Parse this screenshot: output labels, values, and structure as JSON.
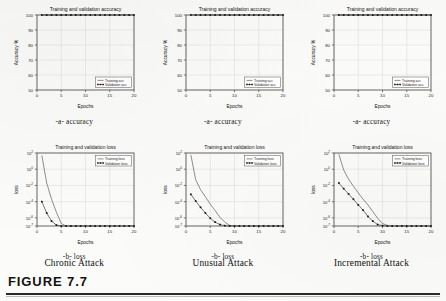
{
  "figure": {
    "label": "FIGURE 7.7"
  },
  "columns": [
    {
      "attack_caption": "Chronic Attack",
      "accuracy_subcaption": "-a- accuracy",
      "loss_subcaption": "-b- loss"
    },
    {
      "attack_caption": "Unusual Attack",
      "accuracy_subcaption": "-a- accuracy",
      "loss_subcaption": "-b- loss"
    },
    {
      "attack_caption": "Incremental Attack",
      "accuracy_subcaption": "-a- accuracy",
      "loss_subcaption": "-b- loss"
    }
  ],
  "chart_data": [
    {
      "type": "line",
      "panel": "chronic-accuracy",
      "title": "Training and validation accuracy",
      "xlabel": "Epochs",
      "ylabel": "Accuracy %",
      "xlim": [
        0,
        20
      ],
      "ylim": [
        50,
        100
      ],
      "xticks": [
        0,
        5,
        10,
        15,
        20
      ],
      "yticks": [
        50,
        60,
        70,
        80,
        90,
        100
      ],
      "grid": true,
      "legend_position": "lower right",
      "series": [
        {
          "name": "Training acc",
          "marker": "none",
          "x": [
            1,
            2,
            3,
            4,
            5,
            6,
            7,
            8,
            9,
            10,
            11,
            12,
            13,
            14,
            15,
            16,
            17,
            18,
            19,
            20
          ],
          "values": [
            100,
            100,
            100,
            100,
            100,
            100,
            100,
            100,
            100,
            100,
            100,
            100,
            100,
            100,
            100,
            100,
            100,
            100,
            100,
            100
          ]
        },
        {
          "name": "Validation acc",
          "marker": "square",
          "x": [
            1,
            2,
            3,
            4,
            5,
            6,
            7,
            8,
            9,
            10,
            11,
            12,
            13,
            14,
            15,
            16,
            17,
            18,
            19,
            20
          ],
          "values": [
            100,
            100,
            100,
            100,
            100,
            100,
            100,
            100,
            100,
            100,
            100,
            100,
            100,
            100,
            100,
            100,
            100,
            100,
            100,
            100
          ]
        }
      ]
    },
    {
      "type": "line",
      "panel": "chronic-loss",
      "title": "Training and validation loss",
      "xlabel": "Epochs",
      "ylabel": "loss",
      "yscale": "log",
      "xlim": [
        0,
        20
      ],
      "ylim": [
        1e-07,
        100.0
      ],
      "xticks": [
        0,
        5,
        10,
        15,
        20
      ],
      "yticks": [
        "10^2",
        "10^0",
        "10^-2",
        "10^-4",
        "10^-6",
        "10^-7"
      ],
      "grid": true,
      "legend_position": "upper right",
      "series": [
        {
          "name": "Training loss",
          "marker": "none",
          "x": [
            1,
            2,
            3,
            4,
            5,
            6,
            7,
            8,
            9,
            10,
            11,
            12,
            13,
            14,
            15,
            16,
            17,
            18,
            19,
            20
          ],
          "values": [
            50,
            0.02,
            0.0002,
            5e-06,
            2e-07,
            1e-07,
            1e-07,
            1e-07,
            1e-07,
            1e-07,
            1e-07,
            1e-07,
            1e-07,
            1e-07,
            1e-07,
            1e-07,
            1e-07,
            1e-07,
            1e-07,
            1e-07
          ]
        },
        {
          "name": "Validation loss",
          "marker": "square",
          "x": [
            1,
            2,
            3,
            4,
            5,
            6,
            7,
            8,
            9,
            10,
            11,
            12,
            13,
            14,
            15,
            16,
            17,
            18,
            19,
            20
          ],
          "values": [
            0.0001,
            4e-06,
            4e-07,
            1.3e-07,
            1e-07,
            1e-07,
            1e-07,
            1e-07,
            1e-07,
            1e-07,
            1e-07,
            1e-07,
            1e-07,
            1e-07,
            1e-07,
            1e-07,
            1e-07,
            1e-07,
            1e-07,
            1e-07
          ]
        }
      ]
    },
    {
      "type": "line",
      "panel": "unusual-accuracy",
      "title": "Training and validation accuracy",
      "xlabel": "Epochs",
      "ylabel": "Accuracy %",
      "xlim": [
        0,
        20
      ],
      "ylim": [
        50,
        100
      ],
      "xticks": [
        0,
        5,
        10,
        15,
        20
      ],
      "yticks": [
        50,
        60,
        70,
        80,
        90,
        100
      ],
      "grid": true,
      "legend_position": "lower right",
      "series": [
        {
          "name": "Training acc",
          "marker": "none",
          "x": [
            1,
            2,
            3,
            4,
            5,
            6,
            7,
            8,
            9,
            10,
            11,
            12,
            13,
            14,
            15,
            16,
            17,
            18,
            19,
            20
          ],
          "values": [
            100,
            100,
            100,
            100,
            100,
            100,
            100,
            100,
            100,
            100,
            100,
            100,
            100,
            100,
            100,
            100,
            100,
            100,
            100,
            100
          ]
        },
        {
          "name": "Validation acc",
          "marker": "square",
          "x": [
            1,
            2,
            3,
            4,
            5,
            6,
            7,
            8,
            9,
            10,
            11,
            12,
            13,
            14,
            15,
            16,
            17,
            18,
            19,
            20
          ],
          "values": [
            100,
            100,
            100,
            100,
            100,
            100,
            100,
            100,
            100,
            100,
            100,
            100,
            100,
            100,
            100,
            100,
            100,
            100,
            100,
            100
          ]
        }
      ]
    },
    {
      "type": "line",
      "panel": "unusual-loss",
      "title": "Training and validation loss",
      "xlabel": "Epochs",
      "ylabel": "loss",
      "yscale": "log",
      "xlim": [
        0,
        20
      ],
      "ylim": [
        1e-07,
        100.0
      ],
      "xticks": [
        0,
        5,
        10,
        15,
        20
      ],
      "yticks": [
        "10^2",
        "10^0",
        "10^-2",
        "10^-4",
        "10^-6",
        "10^-7"
      ],
      "grid": true,
      "legend_position": "upper right",
      "series": [
        {
          "name": "Training loss",
          "marker": "none",
          "x": [
            1,
            2,
            3,
            4,
            5,
            6,
            7,
            8,
            9,
            10,
            11,
            12,
            13,
            14,
            15,
            16,
            17,
            18,
            19,
            20
          ],
          "values": [
            60,
            0.05,
            0.003,
            0.0004,
            5e-05,
            8e-06,
            1.2e-06,
            3e-07,
            1.2e-07,
            1e-07,
            1e-07,
            1e-07,
            1e-07,
            1e-07,
            1e-07,
            1e-07,
            1e-07,
            1e-07,
            1e-07,
            1e-07
          ]
        },
        {
          "name": "Validation loss",
          "marker": "square",
          "x": [
            1,
            2,
            3,
            4,
            5,
            6,
            7,
            8,
            9,
            10,
            11,
            12,
            13,
            14,
            15,
            16,
            17,
            18,
            19,
            20
          ],
          "values": [
            0.0008,
            0.00012,
            2e-05,
            4e-06,
            9e-07,
            3e-07,
            1.5e-07,
            1.1e-07,
            1e-07,
            1e-07,
            1e-07,
            1e-07,
            1e-07,
            1e-07,
            1e-07,
            1e-07,
            1e-07,
            1e-07,
            1e-07,
            1e-07
          ]
        }
      ]
    },
    {
      "type": "line",
      "panel": "incremental-accuracy",
      "title": "Training and validation accuracy",
      "xlabel": "Epochs",
      "ylabel": "Accuracy %",
      "xlim": [
        0,
        20
      ],
      "ylim": [
        50,
        100
      ],
      "xticks": [
        0,
        5,
        10,
        15,
        20
      ],
      "yticks": [
        50,
        60,
        70,
        80,
        90,
        100
      ],
      "grid": true,
      "legend_position": "lower right",
      "series": [
        {
          "name": "Training acc",
          "marker": "none",
          "x": [
            1,
            2,
            3,
            4,
            5,
            6,
            7,
            8,
            9,
            10,
            11,
            12,
            13,
            14,
            15,
            16,
            17,
            18,
            19,
            20
          ],
          "values": [
            100,
            100,
            100,
            100,
            100,
            100,
            100,
            100,
            100,
            100,
            100,
            100,
            100,
            100,
            100,
            100,
            100,
            100,
            100,
            100
          ]
        },
        {
          "name": "Validation acc",
          "marker": "square",
          "x": [
            1,
            2,
            3,
            4,
            5,
            6,
            7,
            8,
            9,
            10,
            11,
            12,
            13,
            14,
            15,
            16,
            17,
            18,
            19,
            20
          ],
          "values": [
            100,
            100,
            100,
            100,
            100,
            100,
            100,
            100,
            100,
            100,
            100,
            100,
            100,
            100,
            100,
            100,
            100,
            100,
            100,
            100
          ]
        }
      ]
    },
    {
      "type": "line",
      "panel": "incremental-loss",
      "title": "Training and validation loss",
      "xlabel": "Epochs",
      "ylabel": "loss",
      "yscale": "log",
      "xlim": [
        0,
        20
      ],
      "ylim": [
        1e-07,
        100.0
      ],
      "xticks": [
        0,
        5,
        10,
        15,
        20
      ],
      "yticks": [
        "10^2",
        "10^0",
        "10^-2",
        "10^-4",
        "10^-6",
        "10^-7"
      ],
      "grid": true,
      "legend_position": "upper right",
      "series": [
        {
          "name": "Training loss",
          "marker": "none",
          "x": [
            1,
            2,
            3,
            4,
            5,
            6,
            7,
            8,
            9,
            10,
            11,
            12,
            13,
            14,
            15,
            16,
            17,
            18,
            19,
            20
          ],
          "values": [
            70,
            0.8,
            0.06,
            0.008,
            0.0012,
            0.0002,
            4e-05,
            6e-06,
            9e-07,
            2e-07,
            1.2e-07,
            1e-07,
            1e-07,
            1e-07,
            1e-07,
            1e-07,
            1e-07,
            1e-07,
            1e-07,
            1e-07
          ]
        },
        {
          "name": "Validation loss",
          "marker": "square",
          "x": [
            1,
            2,
            3,
            4,
            5,
            6,
            7,
            8,
            9,
            10,
            11,
            12,
            13,
            14,
            15,
            16,
            17,
            18,
            19,
            20
          ],
          "values": [
            0.02,
            0.004,
            0.0009,
            0.0002,
            4e-05,
            9e-06,
            1.5e-06,
            4e-07,
            1.5e-07,
            1.1e-07,
            1e-07,
            1e-07,
            1e-07,
            1e-07,
            1e-07,
            1e-07,
            1e-07,
            1e-07,
            1e-07,
            1e-07
          ]
        }
      ]
    }
  ]
}
